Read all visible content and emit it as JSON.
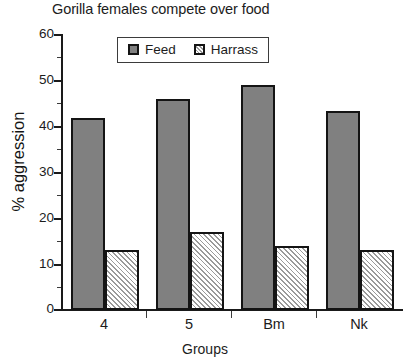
{
  "chart_data": {
    "type": "bar",
    "title": "Gorilla females compete over food",
    "xlabel": "Groups",
    "ylabel": "% aggression",
    "categories": [
      "4",
      "5",
      "Bm",
      "Nk"
    ],
    "series": [
      {
        "name": "Feed",
        "values": [
          42,
          46,
          49,
          43.5
        ],
        "color": "#808080",
        "fill": "solid"
      },
      {
        "name": "Harrass",
        "values": [
          13,
          17,
          14,
          13
        ],
        "color": "#ffffff",
        "fill": "diagonal-hatch"
      }
    ],
    "ylim": [
      0,
      60
    ],
    "ytick_labels": [
      "0",
      "10",
      "20",
      "30",
      "40",
      "50",
      "60"
    ],
    "ytick_values": [
      0,
      10,
      20,
      30,
      40,
      50,
      60
    ],
    "yminor_values": [
      5,
      15,
      25,
      35,
      45,
      55
    ],
    "grid": false,
    "legend_position": "top-center",
    "legend_entries": [
      "Feed",
      "Harrass"
    ]
  },
  "colors": {
    "feed_fill": "#808080",
    "harrass_fill": "#ffffff",
    "hatch": "#9a9a9a",
    "outline": "#141414",
    "text": "#1c1c1c",
    "background": "#ffffff"
  }
}
